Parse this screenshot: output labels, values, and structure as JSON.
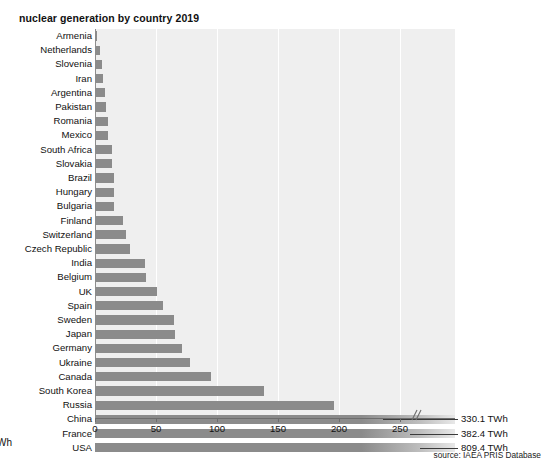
{
  "chart_data": {
    "type": "bar",
    "orientation": "horizontal",
    "title": "nuclear generation by country 2019",
    "xlabel": "TWh",
    "ylabel": "",
    "xlim": [
      0,
      295
    ],
    "xticks": [
      0,
      50,
      100,
      150,
      200,
      250
    ],
    "xtick_labels": [
      "0",
      "50",
      "100",
      "150",
      "200",
      "250"
    ],
    "grid": true,
    "grid_axis": "x",
    "axis_break": true,
    "axis_break_label": "//",
    "legend": false,
    "source": "source: IAEA PRIS Database",
    "bar_color": "#8b8b8b",
    "plot_background": "#efefef",
    "categories": [
      "Armenia",
      "Netherlands",
      "Slovenia",
      "Iran",
      "Argentina",
      "Pakistan",
      "Romania",
      "Mexico",
      "South Africa",
      "Slovakia",
      "Brazil",
      "Hungary",
      "Bulgaria",
      "Finland",
      "Switzerland",
      "Czech Republic",
      "India",
      "Belgium",
      "UK",
      "Spain",
      "Sweden",
      "Japan",
      "Germany",
      "Ukraine",
      "Canada",
      "South Korea",
      "Russia",
      "China",
      "France",
      "USA"
    ],
    "values": [
      2.0,
      3.7,
      5.5,
      6.3,
      8.0,
      9.1,
      10.4,
      10.9,
      13.6,
      14.3,
      15.2,
      15.4,
      15.9,
      22.9,
      25.4,
      28.6,
      40.7,
      41.4,
      51.0,
      55.8,
      64.4,
      65.7,
      71.1,
      78.1,
      94.9,
      138.8,
      195.5,
      330.1,
      382.4,
      809.4
    ],
    "annotations": [
      {
        "category": "China",
        "label": "330.1 TWh"
      },
      {
        "category": "France",
        "label": "382.4 TWh"
      },
      {
        "category": "USA",
        "label": "809.4 TWh"
      }
    ]
  }
}
